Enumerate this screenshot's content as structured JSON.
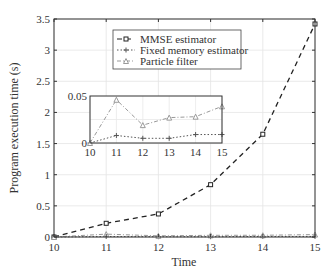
{
  "chart_data": {
    "type": "line",
    "title": "",
    "xlabel": "Time",
    "ylabel": "Program execution time (s)",
    "x": [
      10,
      11,
      12,
      13,
      14,
      15
    ],
    "xlim": [
      10,
      15
    ],
    "ylim": [
      0,
      3.5
    ],
    "xticks": [
      "10",
      "11",
      "12",
      "13",
      "14",
      "15"
    ],
    "yticks": [
      "0",
      "0.5",
      "1",
      "1.5",
      "2",
      "2.5",
      "3",
      "3.5"
    ],
    "grid": true,
    "legend_position": "upper center",
    "series": [
      {
        "name": "MMSE estimator",
        "style": "dashed",
        "marker": "square",
        "color": "#222222",
        "values": [
          0.0,
          0.22,
          0.37,
          0.84,
          1.65,
          3.42
        ]
      },
      {
        "name": "Fixed memory estimator",
        "style": "dotted",
        "marker": "plus",
        "color": "#555555",
        "values": [
          0.0,
          0.008,
          0.005,
          0.005,
          0.009,
          0.009
        ]
      },
      {
        "name": "Particle filter",
        "style": "dashdot",
        "marker": "triangle",
        "color": "#999999",
        "values": [
          0.0,
          0.046,
          0.019,
          0.027,
          0.028,
          0.039
        ]
      }
    ],
    "inset": {
      "xlim": [
        10,
        15
      ],
      "ylim": [
        0,
        0.05
      ],
      "xticks": [
        "10",
        "11",
        "12",
        "13",
        "14",
        "15"
      ],
      "yticks": [
        "0",
        "0.05"
      ],
      "series_shown": [
        "Fixed memory estimator",
        "Particle filter"
      ]
    }
  }
}
